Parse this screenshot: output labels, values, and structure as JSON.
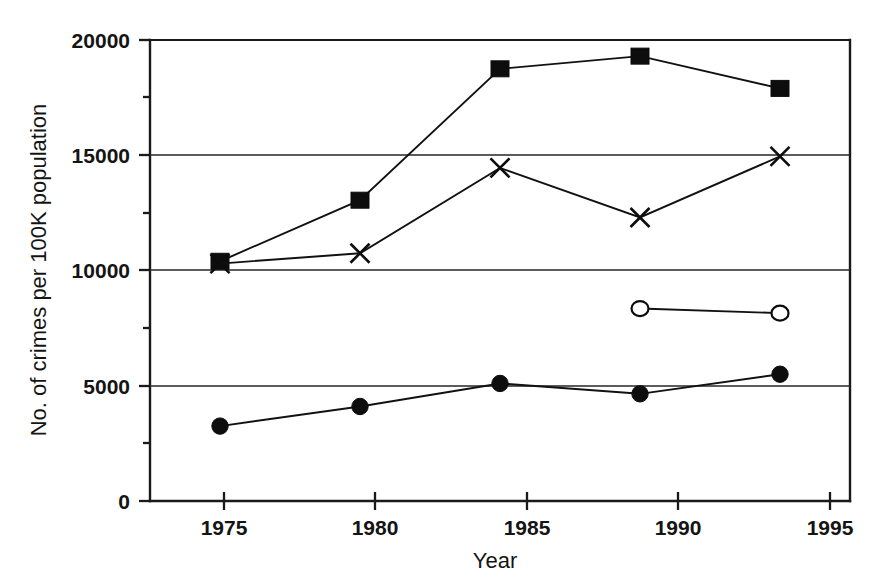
{
  "chart_data": {
    "type": "line",
    "title": "",
    "xlabel": "Year",
    "ylabel": "No. of crimes per 100K population",
    "x": [
      1975,
      1980,
      1985,
      1990,
      1995
    ],
    "xtick_labels": [
      "1975",
      "1980",
      "1985",
      "1990",
      "1995"
    ],
    "xlim": [
      1972.5,
      1997.5
    ],
    "ylim": [
      0,
      20000
    ],
    "ytick_labels": [
      "0",
      "5000",
      "10000",
      "15000",
      "20000"
    ],
    "yticks": [
      0,
      5000,
      10000,
      15000,
      20000
    ],
    "yticks_minor": [
      2500,
      7500,
      12500,
      17500
    ],
    "grid": "horizontal-major",
    "legend": "none",
    "series": [
      {
        "name": "filled-square-series",
        "marker": "filled-square",
        "x": [
          1975,
          1980,
          1985,
          1990,
          1995
        ],
        "values": [
          10400,
          13050,
          18750,
          19300,
          17900
        ]
      },
      {
        "name": "cross-series",
        "marker": "cross",
        "x": [
          1975,
          1980,
          1985,
          1990,
          1995
        ],
        "values": [
          10300,
          10750,
          14450,
          12300,
          14950
        ]
      },
      {
        "name": "open-circle-series",
        "marker": "open-circle",
        "x": [
          1990,
          1995
        ],
        "values": [
          8350,
          8150
        ]
      },
      {
        "name": "filled-circle-series",
        "marker": "filled-circle",
        "x": [
          1975,
          1980,
          1985,
          1990,
          1995
        ],
        "values": [
          3250,
          4100,
          5100,
          4650,
          5500
        ]
      }
    ]
  },
  "labels": {
    "y_20000": "20000",
    "y_15000": "15000",
    "y_10000": "10000",
    "y_5000": "5000",
    "y_0": "0",
    "x_1975": "1975",
    "x_1980": "1980",
    "x_1985": "1985",
    "x_1990": "1990",
    "x_1995": "1995",
    "x_axis_title": "Year",
    "y_axis_title": "No. of crimes per 100K population"
  },
  "colors": {
    "ink": "#0d0d0d",
    "background": "#ffffff",
    "gridline": "#262626"
  }
}
